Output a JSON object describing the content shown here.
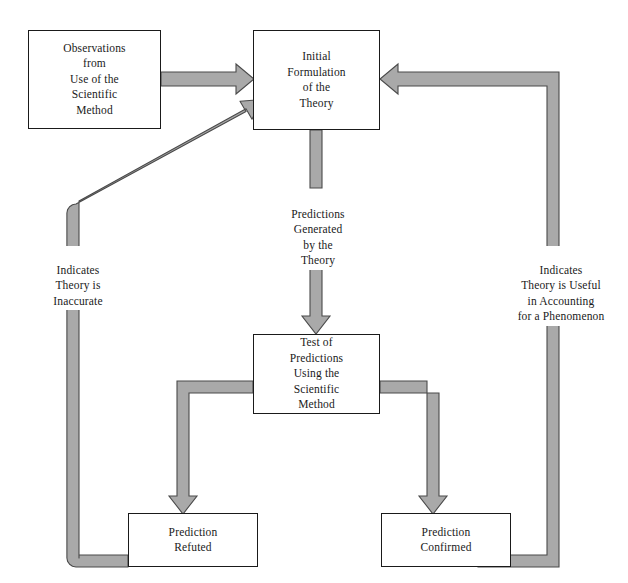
{
  "diagram": {
    "colors": {
      "arrow_fill": "#a9a9a9",
      "arrow_stroke": "#4a4a4a",
      "box_border": "#1a1a1a",
      "text": "#1a1a1a",
      "background": "#ffffff"
    },
    "nodes": [
      {
        "id": "observations",
        "label": "Observations\nfrom\nUse of the\nScientific\nMethod"
      },
      {
        "id": "initial-formulation",
        "label": "Initial\nFormulation\nof the\nTheory"
      },
      {
        "id": "test-of-predictions",
        "label": "Test of\nPredictions\nUsing the\nScientific\nMethod"
      },
      {
        "id": "prediction-refuted",
        "label": "Prediction\nRefuted"
      },
      {
        "id": "prediction-confirmed",
        "label": "Prediction\nConfirmed"
      }
    ],
    "edge_labels": [
      {
        "id": "predictions-generated",
        "label": "Predictions\nGenerated\nby the\nTheory"
      },
      {
        "id": "indicates-inaccurate",
        "label": "Indicates\nTheory is\nInaccurate"
      },
      {
        "id": "indicates-useful",
        "label": "Indicates\nTheory is Useful\nin Accounting\nfor a Phenomenon"
      }
    ],
    "edges": [
      {
        "id": "observations-to-formulation",
        "from": "observations",
        "to": "initial-formulation",
        "style": "straight-horizontal-arrow"
      },
      {
        "id": "formulation-to-test",
        "from": "initial-formulation",
        "to": "test-of-predictions",
        "style": "vertical-arrow-split-by-label"
      },
      {
        "id": "test-to-refuted",
        "from": "test-of-predictions",
        "to": "prediction-refuted",
        "style": "elbow-left-down-arrow"
      },
      {
        "id": "test-to-confirmed",
        "from": "test-of-predictions",
        "to": "prediction-confirmed",
        "style": "elbow-right-down-arrow"
      },
      {
        "id": "refuted-to-formulation",
        "from": "prediction-refuted",
        "to": "initial-formulation",
        "style": "left-loop-diagonal-arrow"
      },
      {
        "id": "confirmed-to-formulation",
        "from": "prediction-confirmed",
        "to": "initial-formulation",
        "style": "right-loop-elbow-arrow"
      }
    ]
  }
}
